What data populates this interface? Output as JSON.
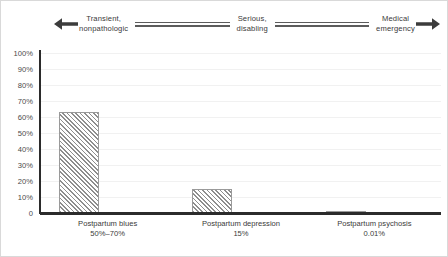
{
  "figure": {
    "border_color": "#d9d9d9",
    "background": "#ffffff"
  },
  "spectrum": {
    "left_arrow_icon": "arrow-left-icon",
    "right_arrow_icon": "arrow-right-icon",
    "stages": [
      {
        "line1": "Transient,",
        "line2": "nonpathologic"
      },
      {
        "line1": "Serious,",
        "line2": "disabling"
      },
      {
        "line1": "Medical",
        "line2": "emergency"
      }
    ],
    "labels": [
      "Transient,\nnonpathologic",
      "Serious,\ndisabling",
      "Medical\nemergency"
    ],
    "connector_count": 2,
    "line_color": "#5c5c5c",
    "text_color": "#3a3a3a"
  },
  "chart_data": {
    "type": "bar",
    "title": "",
    "subtitle": "",
    "xlabel": "",
    "ylabel": "",
    "categories": [
      "Postpartum blues",
      "Postpartum depression",
      "Postpartum psychosis"
    ],
    "value_labels": [
      "50%–70%",
      "15%",
      "0.01%"
    ],
    "values": [
      63,
      15,
      0.01
    ],
    "tick_labels": [
      "100%",
      "90%",
      "80%",
      "70%",
      "60%",
      "50%",
      "40%",
      "30%",
      "20%",
      "10%",
      "0"
    ],
    "tick_values": [
      100,
      90,
      80,
      70,
      60,
      50,
      40,
      30,
      20,
      10,
      0
    ],
    "ylim": [
      0,
      100
    ],
    "grid": true,
    "grid_orientation": "horizontal",
    "legend": false,
    "legend_position": "none",
    "bar_fill": "hatched-diagonal",
    "bar_hatch_color": "#8e8e8e",
    "axis_color": "#2b2b2b",
    "gridline_color": "#f1f1f1"
  },
  "x_axis_labels": [
    {
      "name": "Postpartum blues",
      "value": "50%–70%"
    },
    {
      "name": "Postpartum depression",
      "value": "15%"
    },
    {
      "name": "Postpartum psychosis",
      "value": "0.01%"
    }
  ]
}
